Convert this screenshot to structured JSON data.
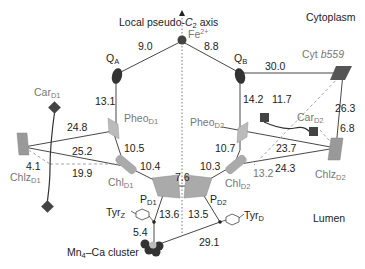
{
  "diagram": {
    "axis_label": "Local pseudo-C2 axis",
    "axis_label_parts": {
      "prefix": "Local pseudo-",
      "c": "C",
      "sub": "2",
      "suffix": " axis"
    },
    "regions": {
      "top": "Cytoplasm",
      "bottom": "Lumen"
    },
    "components": {
      "fe": {
        "base": "Fe",
        "sup": "2+"
      },
      "qa": {
        "base": "Q",
        "sub": "A"
      },
      "qb": {
        "base": "Q",
        "sub": "B"
      },
      "cyt": {
        "prefix": "Cyt ",
        "italic": "b559"
      },
      "pheo_d1": {
        "base": "Pheo",
        "sub": "D1"
      },
      "pheo_d2": {
        "base": "Pheo",
        "sub": "D2"
      },
      "car_d1": {
        "base": "Car",
        "sub": "D1"
      },
      "car_d2": {
        "base": "Car",
        "sub": "D2"
      },
      "chl_d1": {
        "base": "Chl",
        "sub": "D1"
      },
      "chl_d2": {
        "base": "Chl",
        "sub": "D2"
      },
      "chlz_d1": {
        "base": "Chlz",
        "sub": "D1"
      },
      "chlz_d2": {
        "base": "Chlz",
        "sub": "D2"
      },
      "p_d1": {
        "base": "P",
        "sub": "D1"
      },
      "p_d2": {
        "base": "P",
        "sub": "D2"
      },
      "tyr_z": {
        "base": "Tyr",
        "sub": "Z"
      },
      "tyr_d": {
        "base": "Tyr",
        "sub": "D"
      },
      "mn": {
        "base": "Mn",
        "sub": "4",
        "suffix": "–Ca cluster"
      }
    },
    "distances": {
      "qa_fe": "9.0",
      "fe_qb": "8.8",
      "qb_cyt": "30.0",
      "qa_pheo": "13.1",
      "qb_pheo": "14.2",
      "cyt_chlz2_dashed": "11.7",
      "cyt_chlz2": "26.3",
      "car2_chlz2": "6.8",
      "chlz1_pheo1": "24.8",
      "chlz1_chl1": "25.2",
      "chlz1_car1": "4.1",
      "chlz1_chl1_dashed": "19.9",
      "pheo1_chl1": "10.5",
      "chl1_p1": "10.4",
      "p1_p2": "7.6",
      "pheo2_chl2": "10.7",
      "chl2_p2": "10.3",
      "chlz2_chl2": "23.7",
      "chlz2_chl2_b": "24.3",
      "car2_chl2_dashed": "13.2",
      "p1_tyrz": "13.6",
      "p2_tyrd": "13.5",
      "tyrz_mn": "5.4",
      "mn_tyrd": "29.1"
    }
  }
}
